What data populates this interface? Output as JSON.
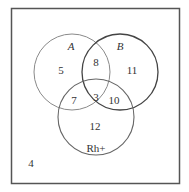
{
  "diagram": {
    "type": "venn",
    "sets": [
      {
        "name": "A",
        "label": "A"
      },
      {
        "name": "B",
        "label": "B"
      },
      {
        "name": "Rh+",
        "label": "Rh+"
      }
    ],
    "regions": {
      "A_only": "5",
      "A_B_only": "8",
      "B_only": "11",
      "A_Rh_only": "7",
      "A_B_Rh": "3",
      "B_Rh_only": "10",
      "Rh_only": "12",
      "outside": "4"
    },
    "colors": {
      "border": "#555555",
      "circle_a": "#888888",
      "circle_b": "#444444",
      "circle_rh": "#666666",
      "text": "#333333"
    }
  }
}
